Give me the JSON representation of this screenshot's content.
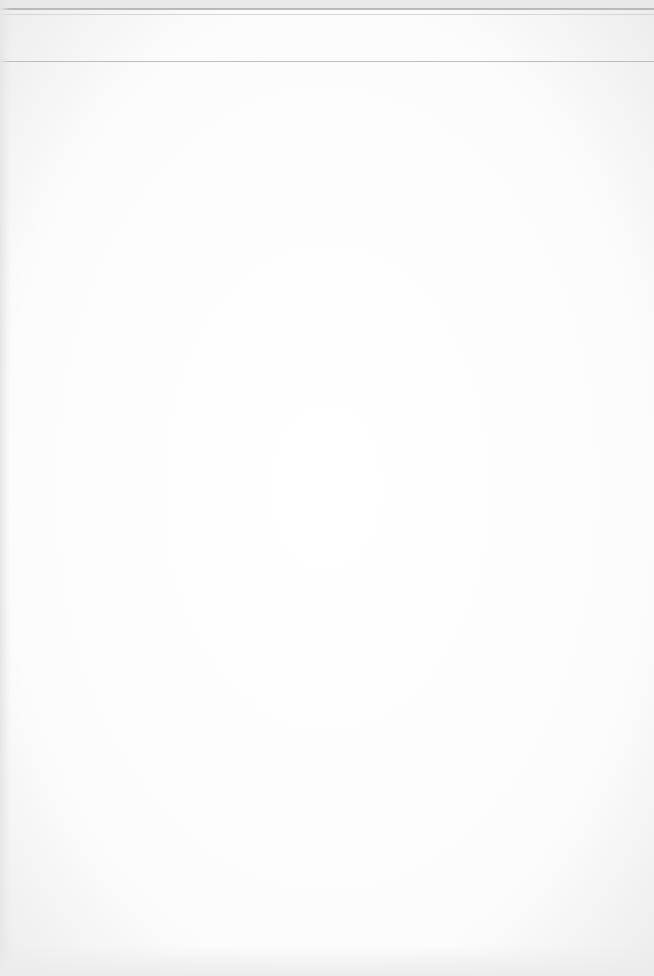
{
  "document": {
    "type": "scanned-page",
    "header": {
      "left_text": "",
      "center_text": "",
      "right_text": ""
    },
    "body_text": "",
    "colors": {
      "page": "#fdfdfd",
      "rule": "#b9b9b9",
      "edge_shadow": "#e6e6e6"
    }
  }
}
